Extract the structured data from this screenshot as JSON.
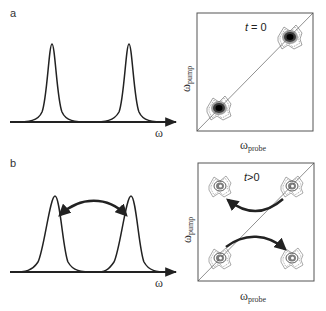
{
  "panels": {
    "a": {
      "label": "a",
      "spectrum": {
        "x_axis_label": "ω",
        "peaks": [
          {
            "name": "peak-1",
            "center_px": 52
          },
          {
            "name": "peak-2",
            "center_px": 129
          }
        ]
      },
      "map2d": {
        "time_label": "t = 0",
        "x_axis_label": "ω",
        "x_axis_sub": "probe",
        "y_axis_label": "ω",
        "y_axis_sub": "pump",
        "peaks": [
          "diagonal-low",
          "diagonal-high"
        ]
      }
    },
    "b": {
      "label": "b",
      "spectrum": {
        "x_axis_label": "ω",
        "peaks": [
          {
            "name": "peak-1",
            "center_px": 55
          },
          {
            "name": "peak-2",
            "center_px": 131
          }
        ],
        "arrow": "double-headed curved arrow between peaks"
      },
      "map2d": {
        "time_label": "t>0",
        "x_axis_label": "ω",
        "x_axis_sub": "probe",
        "y_axis_label": "ω",
        "y_axis_sub": "pump",
        "peaks": [
          "diagonal-low",
          "diagonal-high",
          "cross-peak-upper-left",
          "cross-peak-lower-right"
        ],
        "arrows": [
          "high-diagonal to upper-left cross peak",
          "low-diagonal to lower-right cross peak"
        ]
      }
    }
  },
  "colors": {
    "ink": "#222222",
    "frame": "#555555",
    "background": "#ffffff"
  }
}
